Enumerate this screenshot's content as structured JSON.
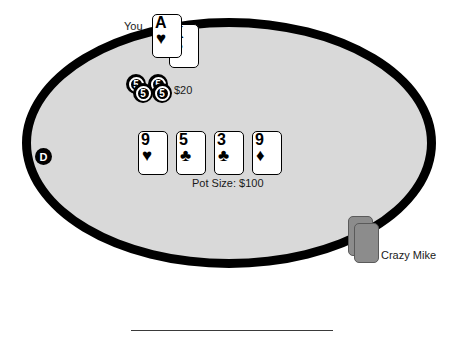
{
  "scene": {
    "title": "Poker Table",
    "table_felt_color": "#d9d9d9",
    "table_border_color": "#000000",
    "background_color": "#ffffff"
  },
  "player": {
    "label": "You",
    "bet_amount": "$20",
    "hole_cards": [
      {
        "rank": "A",
        "suit": "♥",
        "suit_name": "hearts"
      },
      {
        "rank": "K",
        "suit": "♥",
        "suit_name": "hearts"
      }
    ],
    "chips": [
      {
        "value": "5"
      },
      {
        "value": "5"
      },
      {
        "value": "5"
      },
      {
        "value": "5"
      }
    ]
  },
  "board": {
    "pot_label": "Pot Size: $100",
    "community_cards": [
      {
        "rank": "9",
        "suit": "♥",
        "suit_name": "hearts"
      },
      {
        "rank": "5",
        "suit": "♣",
        "suit_name": "clubs"
      },
      {
        "rank": "3",
        "suit": "♣",
        "suit_name": "clubs"
      },
      {
        "rank": "9",
        "suit": "♦",
        "suit_name": "diamonds"
      }
    ]
  },
  "dealer": {
    "button_label": "D"
  },
  "opponent": {
    "name": "Crazy Mike",
    "facedown_card_count": 2
  }
}
